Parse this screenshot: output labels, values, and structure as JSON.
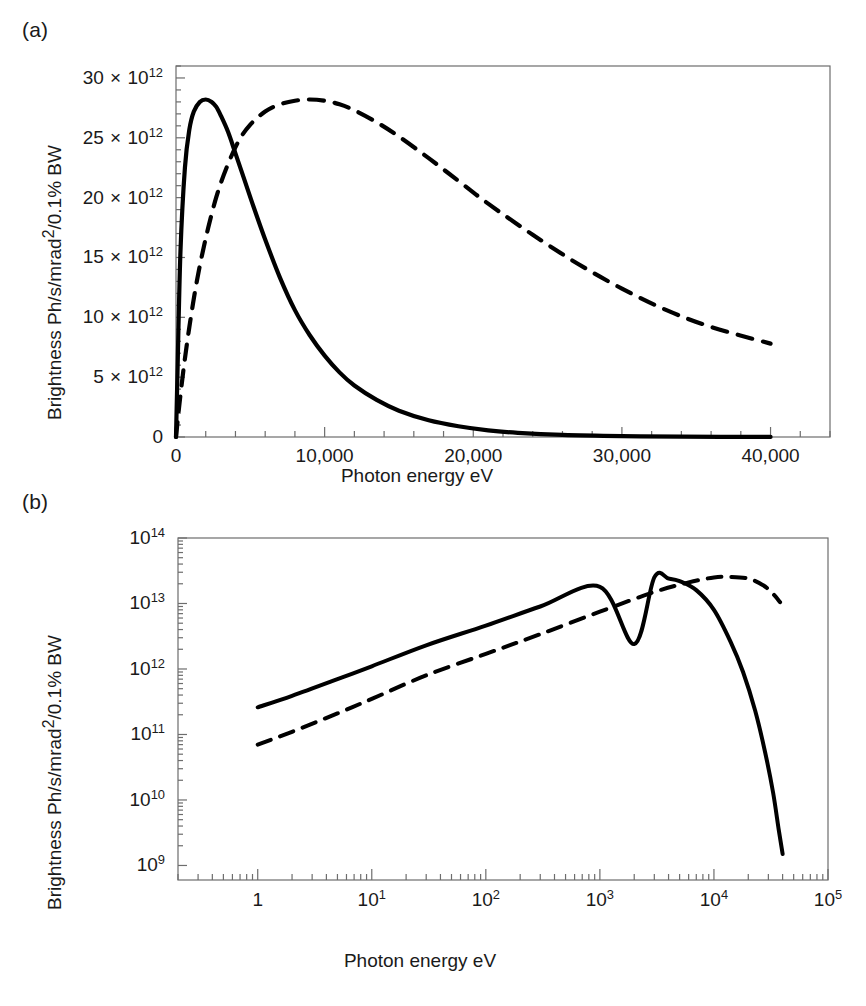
{
  "figure": {
    "background": "#ffffff",
    "line_color": "#000000"
  },
  "panels": [
    {
      "id": "a",
      "label": "(a)",
      "xlabel": "Photon energy eV",
      "ylabel_parts": {
        "pre": "Brightness Ph/s/mrad",
        "sup": "2",
        "post": "/0.1% BW"
      },
      "ylabel": "Brightness Ph/s/mrad2/0.1% BW",
      "xticks": [
        "0",
        "10,000",
        "20,000",
        "30,000",
        "40,000"
      ],
      "xtick_values": [
        0,
        10000,
        20000,
        30000,
        40000
      ],
      "yticks": [
        "0",
        "5 × 10¹²",
        "10 × 10¹²",
        "15 × 10¹²",
        "20 × 10¹²",
        "25 × 10¹²",
        "30 × 10¹²"
      ],
      "ytick_values": [
        0,
        5000000000000.0,
        10000000000000.0,
        15000000000000.0,
        20000000000000.0,
        25000000000000.0,
        30000000000000.0
      ]
    },
    {
      "id": "b",
      "label": "(b)",
      "xlabel": "Photon energy eV",
      "ylabel_parts": {
        "pre": "Brightness Ph/s/mrad",
        "sup": "2",
        "post": "/0.1% BW"
      },
      "ylabel": "Brightness Ph/s/mrad2/0.1% BW",
      "xticks": [
        "1",
        "10¹",
        "10²",
        "10³",
        "10⁴",
        "10⁵"
      ],
      "xtick_values": [
        1,
        10,
        100,
        1000,
        10000,
        100000
      ],
      "yticks": [
        "10⁹",
        "10¹⁰",
        "10¹¹",
        "10¹²",
        "10¹³",
        "10¹⁴"
      ],
      "ytick_values": [
        1000000000.0,
        10000000000.0,
        100000000000.0,
        1000000000000.0,
        10000000000000.0,
        100000000000000.0
      ]
    }
  ],
  "chart_data": [
    {
      "type": "line",
      "panel": "a",
      "title": "",
      "xlabel": "Photon energy eV",
      "ylabel": "Brightness Ph/s/mrad2/0.1% BW",
      "xlim": [
        0,
        44000
      ],
      "ylim": [
        0,
        31000000000000
      ],
      "xscale": "linear",
      "yscale": "linear",
      "grid": false,
      "legend": "none",
      "series": [
        {
          "name": "solid-curve",
          "style": "solid",
          "color": "#000000",
          "x": [
            0,
            100,
            300,
            600,
            900,
            1200,
            1600,
            2000,
            2400,
            2700,
            3000,
            3500,
            4000,
            4600,
            5200,
            6000,
            7000,
            8000,
            9000,
            10000,
            11000,
            12000,
            13500,
            15000,
            17000,
            19000,
            21000,
            23000,
            26000,
            30000,
            34000,
            40000
          ],
          "y": [
            0,
            5400000000000,
            15500000000000,
            22500000000000,
            25700000000000,
            27200000000000,
            28000000000000,
            28200000000000,
            28000000000000,
            27600000000000,
            26900000000000,
            25500000000000,
            23700000000000,
            21500000000000,
            19300000000000,
            16500000000000,
            13300000000000,
            10600000000000,
            8500000000000,
            6800000000000,
            5400000000000,
            4300000000000,
            3100000000000,
            2200000000000,
            1400000000000,
            900000000000,
            560000000000,
            350000000000,
            170000000000,
            70000000000,
            30000000000,
            8000000000
          ]
        },
        {
          "name": "dashed-curve",
          "style": "dashed",
          "color": "#000000",
          "x": [
            0,
            200,
            500,
            900,
            1400,
            2000,
            2700,
            3400,
            4200,
            5000,
            6000,
            7000,
            8000,
            9000,
            10000,
            11000,
            12000,
            13500,
            15000,
            17000,
            19000,
            21000,
            24000,
            27000,
            30000,
            33000,
            36000,
            40000
          ],
          "y": [
            0,
            2400000000000,
            5600000000000,
            9200000000000,
            13000000000000,
            16600000000000,
            20000000000000,
            22500000000000,
            24700000000000,
            26100000000000,
            27200000000000,
            27800000000000,
            28100000000000,
            28200000000000,
            28100000000000,
            27800000000000,
            27300000000000,
            26300000000000,
            25100000000000,
            23300000000000,
            21400000000000,
            19500000000000,
            16900000000000,
            14500000000000,
            12400000000000,
            10600000000000,
            9200000000000,
            7800000000000
          ]
        }
      ]
    },
    {
      "type": "line",
      "panel": "b",
      "title": "",
      "xlabel": "Photon energy eV",
      "ylabel": "Brightness Ph/s/mrad2/0.1% BW",
      "xlim": [
        0.2,
        100000
      ],
      "ylim": [
        600000000,
        100000000000000
      ],
      "xscale": "log",
      "yscale": "log",
      "grid": false,
      "legend": "none",
      "series": [
        {
          "name": "solid-curve",
          "style": "solid",
          "color": "#000000",
          "x": [
            1,
            2,
            5,
            10,
            30,
            100,
            300,
            1000,
            2000,
            3000,
            4000,
            5000,
            7000,
            10000,
            14000,
            18000,
            23000,
            28000,
            33000,
            37000,
            40000
          ],
          "y": [
            260000000000,
            390000000000,
            700000000000,
            1100000000000,
            2300000000000,
            4600000000000,
            9000000000000,
            18000000000000.0,
            2400000000000,
            25000000000000,
            24000000000000,
            22000000000000,
            16000000000000,
            8000000000000,
            2600000000000,
            900000000000,
            230000000000,
            55000000000,
            13000000000,
            3500000000,
            1500000000
          ]
        },
        {
          "name": "dashed-curve",
          "style": "dashed",
          "color": "#000000",
          "x": [
            1,
            2,
            5,
            10,
            30,
            100,
            300,
            1000,
            3000,
            6000,
            10000,
            14000,
            20000,
            27000,
            33000,
            38000
          ],
          "y": [
            70000000000,
            110000000000,
            210000000000,
            350000000000,
            800000000000,
            1700000000000,
            3400000000000,
            7500000000000,
            15000000000000,
            21000000000000,
            25000000000000,
            25500000000000,
            24000000000000,
            19000000000000,
            14000000000000,
            10500000000000
          ]
        }
      ]
    }
  ]
}
